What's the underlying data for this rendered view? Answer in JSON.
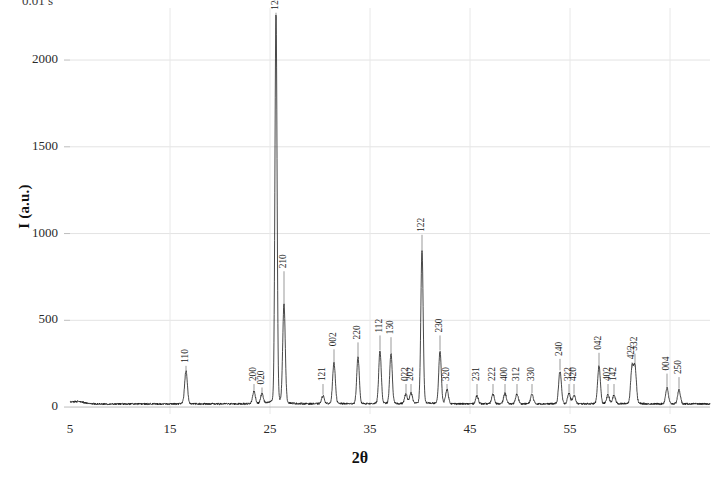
{
  "header_note": "0.01 s",
  "axes": {
    "ylabel": "I (a.u.)",
    "xlabel": "2θ",
    "yticks": [
      "0",
      "500",
      "1000",
      "1500",
      "2000"
    ],
    "xticks": [
      "5",
      "15",
      "25",
      "35",
      "45",
      "55",
      "65"
    ]
  },
  "chart_data": {
    "type": "line",
    "title": "",
    "subtitle": "",
    "xlabel": "2θ",
    "ylabel": "I (a.u.)",
    "xlim": [
      5,
      69
    ],
    "ylim": [
      -40,
      2300
    ],
    "ytick_values": [
      0,
      500,
      1000,
      1500,
      2000
    ],
    "xtick_values": [
      5,
      15,
      25,
      35,
      45,
      55,
      65
    ],
    "grid": "horizontal-and-vertical-light",
    "legend": "none",
    "line_color": "#1a1a1a",
    "background": "#ffffff",
    "baseline": 18,
    "series": [
      {
        "name": "XRD intensity",
        "peaks": [
          {
            "hkl": "110",
            "two_theta": 16.6,
            "intensity": 185,
            "label_y": 255
          },
          {
            "hkl": "200",
            "two_theta": 23.4,
            "intensity": 70,
            "label_y": 150
          },
          {
            "hkl": "020",
            "two_theta": 24.2,
            "intensity": 55,
            "label_y": 130
          },
          {
            "hkl": "120",
            "two_theta": 25.6,
            "intensity": 2205,
            "label_y": 2290
          },
          {
            "hkl": "210",
            "two_theta": 26.4,
            "intensity": 560,
            "label_y": 800
          },
          {
            "hkl": "121",
            "two_theta": 30.3,
            "intensity": 45,
            "label_y": 150
          },
          {
            "hkl": "002",
            "two_theta": 31.4,
            "intensity": 230,
            "label_y": 350
          },
          {
            "hkl": "220",
            "two_theta": 33.8,
            "intensity": 265,
            "label_y": 390
          },
          {
            "hkl": "112",
            "two_theta": 36.0,
            "intensity": 300,
            "label_y": 430
          },
          {
            "hkl": "130",
            "two_theta": 37.1,
            "intensity": 285,
            "label_y": 420
          },
          {
            "hkl": "022",
            "two_theta": 38.6,
            "intensity": 55,
            "label_y": 150
          },
          {
            "hkl": "202",
            "two_theta": 39.1,
            "intensity": 60,
            "label_y": 150
          },
          {
            "hkl": "122",
            "two_theta": 40.2,
            "intensity": 870,
            "label_y": 1010
          },
          {
            "hkl": "230",
            "two_theta": 42.0,
            "intensity": 300,
            "label_y": 430
          },
          {
            "hkl": "320",
            "two_theta": 42.7,
            "intensity": 80,
            "label_y": 150
          },
          {
            "hkl": "231",
            "two_theta": 45.7,
            "intensity": 45,
            "label_y": 150
          },
          {
            "hkl": "222",
            "two_theta": 47.3,
            "intensity": 55,
            "label_y": 150
          },
          {
            "hkl": "400",
            "two_theta": 48.5,
            "intensity": 60,
            "label_y": 150
          },
          {
            "hkl": "312",
            "two_theta": 49.7,
            "intensity": 55,
            "label_y": 150
          },
          {
            "hkl": "330",
            "two_theta": 51.2,
            "intensity": 55,
            "label_y": 150
          },
          {
            "hkl": "240",
            "two_theta": 54.0,
            "intensity": 185,
            "label_y": 295
          },
          {
            "hkl": "322",
            "two_theta": 54.9,
            "intensity": 60,
            "label_y": 150
          },
          {
            "hkl": "420",
            "two_theta": 55.4,
            "intensity": 50,
            "label_y": 150
          },
          {
            "hkl": "042",
            "two_theta": 57.9,
            "intensity": 215,
            "label_y": 330
          },
          {
            "hkl": "402",
            "two_theta": 58.8,
            "intensity": 50,
            "label_y": 150
          },
          {
            "hkl": "142",
            "two_theta": 59.4,
            "intensity": 48,
            "label_y": 150
          },
          {
            "hkl": "422",
            "two_theta": 61.2,
            "intensity": 200,
            "label_y": 275
          },
          {
            "hkl": "332",
            "two_theta": 61.5,
            "intensity": 205,
            "label_y": 325
          },
          {
            "hkl": "004",
            "two_theta": 64.7,
            "intensity": 90,
            "label_y": 210
          },
          {
            "hkl": "250",
            "two_theta": 65.9,
            "intensity": 80,
            "label_y": 190
          }
        ]
      }
    ]
  }
}
